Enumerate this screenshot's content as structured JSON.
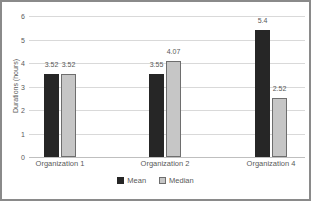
{
  "chart_data": {
    "type": "bar",
    "title": "",
    "categories": [
      "Organization 1",
      "Organization 2",
      "Organization 4"
    ],
    "series": [
      {
        "name": "Mean",
        "values": [
          3.52,
          3.55,
          5.4
        ],
        "labels": [
          "3.52",
          "3.55",
          "5.4"
        ],
        "fill": "#262626",
        "border": "#262626"
      },
      {
        "name": "Median",
        "values": [
          3.52,
          4.07,
          2.52
        ],
        "labels": [
          "3.52",
          "4.07",
          "2.52"
        ],
        "fill": "#c6c6c6",
        "border": "#6e6e6e"
      }
    ],
    "xlabel": "",
    "ylabel": "Durations (hours)",
    "ylim": [
      0,
      6
    ],
    "yticks": [
      0,
      1,
      2,
      3,
      4,
      5,
      6
    ],
    "grid": true,
    "legend_position": "bottom",
    "colors": {
      "grid": "#d9d9d9",
      "axis_text": "#595959",
      "chart_border": "#8a8a8a",
      "background": "#ffffff"
    }
  }
}
